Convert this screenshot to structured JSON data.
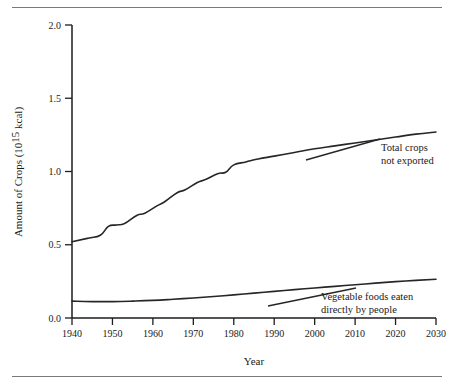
{
  "figure": {
    "has_top_rule": true,
    "has_bottom_rule": true,
    "background": "#ffffff",
    "ink_color": "#262626"
  },
  "chart_data": {
    "type": "line",
    "title": "",
    "xlabel": "Year",
    "ylabel_main": "Amount of Crops (10",
    "ylabel_exponent": "15",
    "ylabel_tail": " kcal)",
    "ylabel_full": "Amount of Crops (10^15 kcal)",
    "xlim": [
      1940,
      2030
    ],
    "ylim": [
      0.0,
      2.0
    ],
    "xticks": [
      1940,
      1950,
      1960,
      1970,
      1980,
      1990,
      2000,
      2010,
      2020,
      2030
    ],
    "xticklabels": [
      "1940",
      "1950",
      "1960",
      "1970",
      "1980",
      "1990",
      "2000",
      "2010",
      "2020",
      "2030"
    ],
    "yticks": [
      0.0,
      0.5,
      1.0,
      1.5,
      2.0
    ],
    "yticklabels": [
      "0.0",
      "0.5",
      "1.0",
      "1.5",
      "2.0"
    ],
    "grid": false,
    "legend_position": "inline-annotations",
    "series": [
      {
        "name": "Total crops not exported",
        "label_line1": "Total crops",
        "label_line2": "not exported",
        "x": [
          1940,
          1944,
          1947,
          1949,
          1951,
          1953,
          1956,
          1958,
          1961,
          1963,
          1966,
          1968,
          1971,
          1973,
          1976,
          1978,
          1980,
          1983,
          1986,
          1990,
          1995,
          2000,
          2005,
          2010,
          2015,
          2020,
          2025,
          2030
        ],
        "values": [
          0.52,
          0.545,
          0.565,
          0.625,
          0.635,
          0.645,
          0.7,
          0.715,
          0.765,
          0.795,
          0.855,
          0.875,
          0.925,
          0.945,
          0.985,
          0.995,
          1.045,
          1.065,
          1.085,
          1.105,
          1.13,
          1.155,
          1.175,
          1.195,
          1.215,
          1.235,
          1.255,
          1.27
        ]
      },
      {
        "name": "Vegetable foods eaten directly by people",
        "label_line1": "Vegetable foods eaten",
        "label_line2": "directly by people",
        "x": [
          1940,
          1945,
          1950,
          1955,
          1960,
          1965,
          1970,
          1975,
          1980,
          1985,
          1990,
          1995,
          2000,
          2005,
          2010,
          2015,
          2020,
          2025,
          2030
        ],
        "values": [
          0.115,
          0.112,
          0.112,
          0.115,
          0.12,
          0.128,
          0.137,
          0.147,
          0.158,
          0.17,
          0.182,
          0.194,
          0.205,
          0.216,
          0.227,
          0.238,
          0.248,
          0.257,
          0.265
        ]
      }
    ]
  }
}
